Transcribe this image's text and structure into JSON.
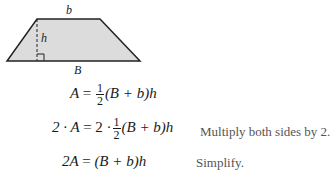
{
  "figure": {
    "shape": "trapezoid",
    "labels": {
      "top": "b",
      "height": "h",
      "bottom": "B"
    },
    "fill_color": "#dcdcdc",
    "stroke_color": "#222222"
  },
  "equations": [
    {
      "lhs": "A",
      "eq": "=",
      "frac_num": "1",
      "frac_den": "2",
      "rhs": "(B + b)h",
      "note": ""
    },
    {
      "lhs": "2 · A",
      "eq": "=",
      "pre": "2 ·",
      "frac_num": "1",
      "frac_den": "2",
      "rhs": "(B + b)h",
      "note": "Multiply both sides by 2."
    },
    {
      "lhs": "2A",
      "eq": "=",
      "rhs": "(B + b)h",
      "note": "Simplify."
    }
  ]
}
